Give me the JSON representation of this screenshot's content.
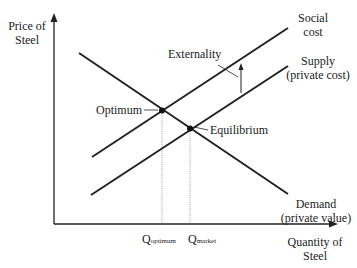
{
  "diagram": {
    "type": "supply-demand-externality",
    "axes": {
      "y_label_line1": "Price of",
      "y_label_line2": "Steel",
      "x_label_line1": "Quantity of",
      "x_label_line2": "Steel"
    },
    "curves": {
      "social_cost": {
        "line1": "Social",
        "line2": "cost"
      },
      "supply": {
        "line1": "Supply",
        "line2": "(private cost)"
      },
      "demand": {
        "line1": "Demand",
        "line2": "(private value)"
      }
    },
    "points": {
      "optimum": "Optimum",
      "equilibrium": "Equilibrium"
    },
    "annotations": {
      "externality": "Externality"
    },
    "quantities": {
      "q_optimum_main": "Q",
      "q_optimum_sub": "optimum",
      "q_market_main": "Q",
      "q_market_sub": "market"
    },
    "colors": {
      "line": "#222222",
      "guide": "#888888",
      "background": "#ffffff"
    }
  }
}
